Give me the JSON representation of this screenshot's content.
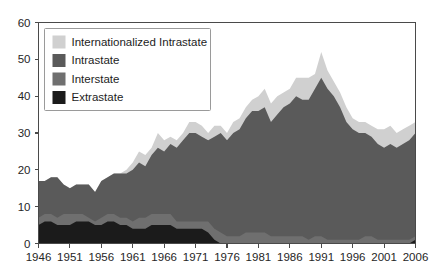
{
  "chart_data": {
    "type": "area",
    "stacked": true,
    "title": "",
    "subtitle": "",
    "xlabel": "",
    "ylabel": "",
    "xlim": [
      1946,
      2006
    ],
    "ylim": [
      0,
      60
    ],
    "grid": false,
    "legend_position": "top-left",
    "x_tick_labels": [
      "1946",
      "1951",
      "1956",
      "1961",
      "1966",
      "1971",
      "1976",
      "1981",
      "1986",
      "1991",
      "1996",
      "2001",
      "2006"
    ],
    "x_ticks": [
      1946,
      1951,
      1956,
      1961,
      1966,
      1971,
      1976,
      1981,
      1986,
      1991,
      1996,
      2001,
      2006
    ],
    "y_tick_labels": [
      "0",
      "10",
      "20",
      "30",
      "40",
      "50",
      "60"
    ],
    "y_ticks": [
      0,
      10,
      20,
      30,
      40,
      50,
      60
    ],
    "x": [
      1946,
      1947,
      1948,
      1949,
      1950,
      1951,
      1952,
      1953,
      1954,
      1955,
      1956,
      1957,
      1958,
      1959,
      1960,
      1961,
      1962,
      1963,
      1964,
      1965,
      1966,
      1967,
      1968,
      1969,
      1970,
      1971,
      1972,
      1973,
      1974,
      1975,
      1976,
      1977,
      1978,
      1979,
      1980,
      1981,
      1982,
      1983,
      1984,
      1985,
      1986,
      1987,
      1988,
      1989,
      1990,
      1991,
      1992,
      1993,
      1994,
      1995,
      1996,
      1997,
      1998,
      1999,
      2000,
      2001,
      2002,
      2003,
      2004,
      2005,
      2006
    ],
    "series": [
      {
        "name": "Extrastate",
        "color": "#1b1b1b",
        "values": [
          5,
          6,
          6,
          5,
          5,
          5,
          6,
          6,
          6,
          5,
          5,
          6,
          6,
          5,
          5,
          4,
          4,
          4,
          5,
          5,
          5,
          5,
          4,
          4,
          4,
          4,
          4,
          3,
          1,
          0,
          0,
          0,
          0,
          0,
          0,
          0,
          0,
          0,
          0,
          0,
          0,
          0,
          0,
          0,
          0,
          0,
          0,
          0,
          0,
          0,
          0,
          0,
          0,
          0,
          0,
          0,
          0,
          0,
          0,
          0,
          1
        ]
      },
      {
        "name": "Interstate",
        "color": "#6f6f6f",
        "values": [
          2,
          2,
          2,
          2,
          3,
          3,
          2,
          2,
          1,
          1,
          2,
          2,
          2,
          2,
          2,
          2,
          3,
          3,
          3,
          3,
          3,
          3,
          2,
          2,
          2,
          2,
          2,
          3,
          3,
          3,
          2,
          2,
          2,
          3,
          3,
          3,
          3,
          2,
          2,
          2,
          2,
          2,
          2,
          1,
          2,
          2,
          1,
          1,
          1,
          1,
          1,
          1,
          2,
          2,
          1,
          1,
          1,
          1,
          1,
          1,
          1
        ]
      },
      {
        "name": "Intrastate",
        "color": "#5a5a5a",
        "values": [
          10,
          9,
          10,
          11,
          8,
          7,
          8,
          8,
          9,
          8,
          10,
          10,
          11,
          12,
          12,
          14,
          15,
          14,
          16,
          18,
          17,
          19,
          20,
          22,
          24,
          24,
          23,
          22,
          25,
          27,
          26,
          28,
          29,
          31,
          33,
          33,
          34,
          31,
          33,
          35,
          36,
          38,
          37,
          38,
          40,
          43,
          41,
          39,
          36,
          32,
          30,
          29,
          28,
          27,
          26,
          25,
          26,
          25,
          26,
          27,
          28
        ]
      },
      {
        "name": "Internationalized Intrastate",
        "color": "#d0d0d0",
        "values": [
          0,
          0,
          0,
          0,
          0,
          0,
          0,
          0,
          0,
          0,
          0,
          0,
          0,
          0,
          1,
          2,
          3,
          3,
          2,
          4,
          3,
          2,
          2,
          2,
          3,
          3,
          3,
          2,
          3,
          2,
          2,
          3,
          3,
          3,
          3,
          4,
          5,
          5,
          5,
          4,
          4,
          5,
          6,
          6,
          4,
          7,
          5,
          4,
          4,
          4,
          3,
          3,
          3,
          3,
          4,
          5,
          5,
          4,
          4,
          4,
          3
        ]
      }
    ],
    "legend_entries": [
      {
        "label": "Internationalized Intrastate",
        "color": "#d0d0d0"
      },
      {
        "label": "Intrastate",
        "color": "#5a5a5a"
      },
      {
        "label": "Interstate",
        "color": "#6f6f6f"
      },
      {
        "label": "Extrastate",
        "color": "#1b1b1b"
      }
    ]
  }
}
